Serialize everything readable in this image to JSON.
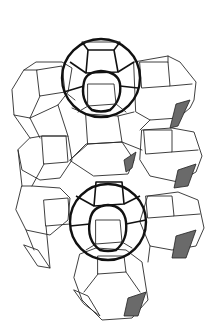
{
  "figure": {
    "type": "zeolite framework line drawing",
    "colors": {
      "background": "#ffffff",
      "line": "#2a2a2a",
      "highlight": "#111111",
      "shaded_faces": "#6a6a6a"
    },
    "highlighted_cages": [
      {
        "label": "upper cage",
        "cx": 100,
        "cy": 78,
        "r": 38
      },
      {
        "label": "lower cage",
        "cx": 108,
        "cy": 222,
        "r": 38
      }
    ]
  }
}
